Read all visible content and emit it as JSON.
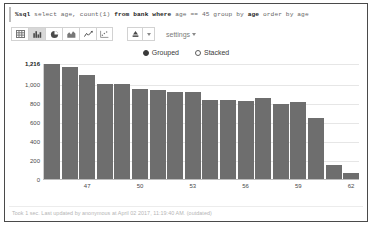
{
  "editor": {
    "query": "%sql select age, count(1) from bank where age == 45 group by age order by age",
    "magic": "%sql",
    "part1": " select age, count(1) ",
    "kw_from": "from",
    "part2": " bank ",
    "kw_where": "where",
    "part3": " age == 45 ",
    "kw_group": "group by",
    "part4": " age ",
    "kw_order": "order by",
    "part5": " age"
  },
  "toolbar": {
    "chart_types": [
      {
        "name": "table-chart-icon",
        "label": "Table",
        "active": false
      },
      {
        "name": "bar-chart-icon",
        "label": "Bar Chart",
        "active": true
      },
      {
        "name": "pie-chart-icon",
        "label": "Pie Chart",
        "active": false
      },
      {
        "name": "area-chart-icon",
        "label": "Area Chart",
        "active": false
      },
      {
        "name": "line-chart-icon",
        "label": "Line Chart",
        "active": false
      },
      {
        "name": "scatter-chart-icon",
        "label": "Scatter Chart",
        "active": false
      }
    ],
    "download_icon": "download-icon",
    "download_caret": "chevron-down-icon",
    "settings_label": "settings"
  },
  "modes": {
    "options": [
      {
        "label": "Grouped",
        "selected": true
      },
      {
        "label": "Stacked",
        "selected": false
      }
    ]
  },
  "status": {
    "text": "Took 1 sec. Last updated by anonymous at April 02 2017, 11:19:40 AM. (outdated)"
  },
  "colors": {
    "bar": "#6e6e6e",
    "grid": "#e6e6e6",
    "border": "#4a4a4a",
    "muted_text": "#b5b5b5"
  },
  "chart_data": {
    "type": "bar",
    "title": "",
    "xlabel": "age",
    "ylabel": "count(1)",
    "grid": true,
    "legend": "none",
    "ylim": [
      0,
      1216
    ],
    "yticks": [
      "0",
      "200",
      "400",
      "600",
      "800",
      "1,000",
      "1,216"
    ],
    "ytick_values": [
      0,
      200,
      400,
      600,
      800,
      1000,
      1216
    ],
    "xticks": [
      "47",
      "50",
      "53",
      "56",
      "59",
      "62"
    ],
    "categories": [
      "45",
      "46",
      "47",
      "48",
      "49",
      "50",
      "51",
      "52",
      "53",
      "54",
      "55",
      "56",
      "57",
      "58",
      "59",
      "60",
      "61",
      "62"
    ],
    "values": [
      1216,
      1180,
      1100,
      1005,
      1005,
      950,
      945,
      925,
      915,
      840,
      835,
      825,
      860,
      790,
      815,
      640,
      150,
      60
    ]
  }
}
